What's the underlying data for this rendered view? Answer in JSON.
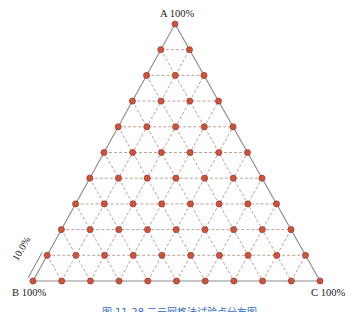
{
  "diagram": {
    "type": "ternary-grid",
    "divisions": 10,
    "vertices": {
      "A": {
        "label": "A 100%",
        "x": 175,
        "y": 24
      },
      "B": {
        "label": "B 100%",
        "x": 33,
        "y": 281
      },
      "C": {
        "label": "C 100%",
        "x": 320,
        "y": 281
      }
    },
    "scale_label": "10.0%",
    "point_count": 66,
    "colors": {
      "point_fill": "#c9553f",
      "point_stroke": "#8a3526",
      "edge": "#8c8c8c",
      "grid": "#b08880",
      "caption": "#3a6fc4"
    }
  },
  "caption": "图 11-28 三元网格法试验点分布图"
}
